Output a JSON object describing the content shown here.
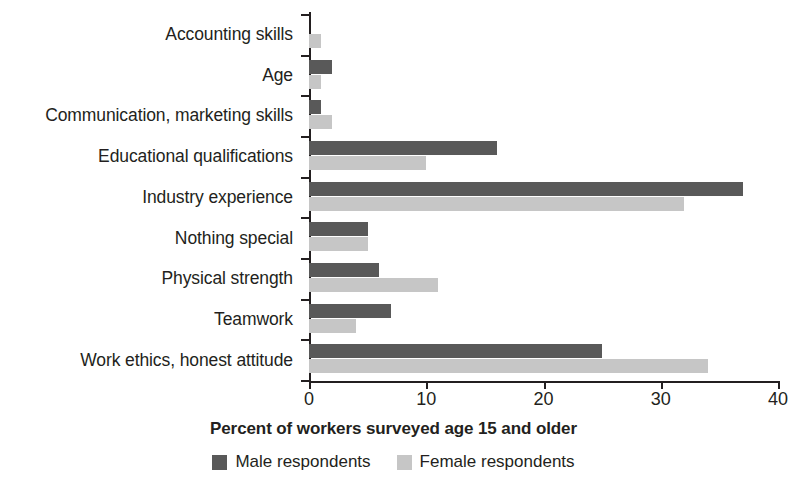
{
  "chart_data": {
    "type": "bar",
    "orientation": "horizontal",
    "title": "",
    "xlabel": "Percent of workers surveyed  age 15 and older",
    "ylabel": "",
    "xlim": [
      0,
      40
    ],
    "xticks": [
      0,
      10,
      20,
      30,
      40
    ],
    "xtick_labels": [
      "0",
      "10",
      "20",
      "30",
      "40"
    ],
    "grid": false,
    "legend_position": "bottom",
    "categories": [
      "Accounting skills",
      "Age",
      "Communication, marketing skills",
      "Educational qualifications",
      "Industry experience",
      "Nothing special",
      "Physical strength",
      "Teamwork",
      "Work ethics, honest attitude"
    ],
    "series": [
      {
        "name": "Male respondents",
        "color": "#595959",
        "values": [
          0,
          2,
          1,
          16,
          37,
          5,
          6,
          7,
          25
        ]
      },
      {
        "name": "Female respondents",
        "color": "#c6c6c6",
        "values": [
          1,
          1,
          2,
          10,
          32,
          5,
          11,
          4,
          34
        ]
      }
    ]
  },
  "legend": {
    "items": [
      {
        "label": "Male respondents"
      },
      {
        "label": "Female respondents"
      }
    ]
  }
}
